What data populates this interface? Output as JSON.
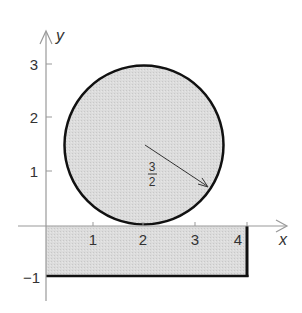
{
  "diagram": {
    "type": "coordinate-plane-figure",
    "axes": {
      "x_label": "x",
      "y_label": "y",
      "x_ticks": [
        "1",
        "2",
        "3",
        "4"
      ],
      "y_ticks": [
        "3",
        "2",
        "1",
        "−1"
      ]
    },
    "circle": {
      "center": [
        2,
        1.5
      ],
      "radius_label_num": "3",
      "radius_label_den": "2",
      "fill": "#d9d9d9",
      "stroke": "#111111"
    },
    "rectangle": {
      "x_range": [
        0,
        4
      ],
      "y_range": [
        -1,
        0
      ],
      "fill": "#d9d9d9",
      "stroke": "#111111"
    },
    "colors": {
      "axis": "#999999",
      "shape_fill": "#d9d9d9",
      "outline": "#111111",
      "text": "#333333"
    }
  }
}
